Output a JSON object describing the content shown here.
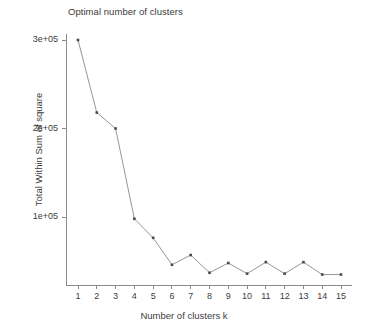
{
  "chart_data": {
    "type": "line",
    "title": "Optimal number of clusters",
    "xlabel": "Number of clusters k",
    "ylabel": "Total Within Sum of square",
    "x": [
      1,
      2,
      3,
      4,
      5,
      6,
      7,
      8,
      9,
      10,
      11,
      12,
      13,
      14,
      15
    ],
    "values": [
      300000,
      218000,
      200000,
      98000,
      76500,
      46000,
      57000,
      37000,
      48000,
      36000,
      49000,
      36000,
      49000,
      35000,
      35000
    ],
    "series": [
      {
        "name": "Total Within Sum of square",
        "values": [
          300000,
          218000,
          200000,
          98000,
          76500,
          46000,
          57000,
          37000,
          48000,
          36000,
          49000,
          36000,
          49000,
          35000,
          35000
        ]
      }
    ],
    "x_tick_labels": [
      "1",
      "2",
      "3",
      "4",
      "5",
      "6",
      "7",
      "8",
      "9",
      "10",
      "11",
      "12",
      "13",
      "14",
      "15"
    ],
    "y_tick_labels": [
      "1e+05",
      "2e+05",
      "3e+05"
    ],
    "y_tick_values": [
      100000,
      200000,
      300000
    ],
    "xlim": [
      1,
      15
    ],
    "ylim": [
      28000,
      305000
    ],
    "grid": false,
    "legend": null,
    "line_color": "#8a8a8a",
    "marker_color": "#4a4a4a",
    "axis_color": "#8a8a8a",
    "marker": "square"
  }
}
